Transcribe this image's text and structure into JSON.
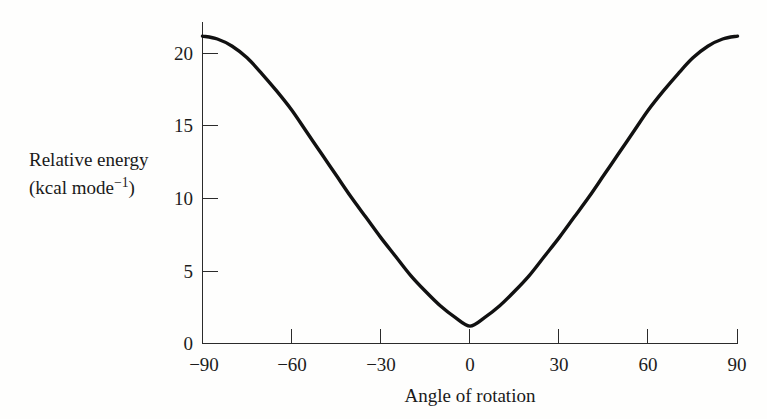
{
  "chart_data": {
    "type": "line",
    "title": "",
    "subtitle": "",
    "xlabel": "Angle of rotation",
    "ylabel_line1": "Relative energy",
    "ylabel_line2_prefix": "(kcal mode",
    "ylabel_line2_exponent": "−1",
    "ylabel_line2_suffix": ")",
    "ylabel_plain": "Relative energy (kcal mode−1)",
    "xlim": [
      -90,
      90
    ],
    "ylim": [
      0,
      22.5
    ],
    "xticks": [
      -90,
      -60,
      -30,
      0,
      30,
      60,
      90
    ],
    "xtick_labels": [
      "−90",
      "−60",
      "−30",
      "0",
      "30",
      "60",
      "90"
    ],
    "yticks": [
      0,
      5,
      10,
      15,
      20
    ],
    "ytick_labels": [
      "0",
      "5",
      "10",
      "15",
      "20"
    ],
    "grid": false,
    "legend": null,
    "tick_direction": "in",
    "axis_style": "left-and-bottom-spine",
    "curve_color": "#111111",
    "axis_color": "#2b2b2b",
    "background_color": "#fefefd",
    "series": [
      {
        "name": "Relative energy",
        "x": [
          -90,
          -85,
          -80,
          -75,
          -70,
          -65,
          -60,
          -55,
          -50,
          -45,
          -40,
          -35,
          -30,
          -25,
          -20,
          -15,
          -10,
          -5,
          0,
          5,
          10,
          15,
          20,
          25,
          30,
          35,
          40,
          45,
          50,
          55,
          60,
          65,
          70,
          75,
          80,
          85,
          90
        ],
        "y": [
          21.2,
          21.0,
          20.5,
          19.7,
          18.6,
          17.4,
          16.1,
          14.6,
          13.1,
          11.6,
          10.1,
          8.7,
          7.3,
          6.0,
          4.7,
          3.6,
          2.6,
          1.8,
          1.2,
          1.8,
          2.6,
          3.6,
          4.7,
          6.0,
          7.3,
          8.7,
          10.1,
          11.6,
          13.1,
          14.6,
          16.1,
          17.4,
          18.6,
          19.7,
          20.5,
          21.0,
          21.2
        ]
      }
    ],
    "annotations": {
      "minimum_value": 1.2,
      "minimum_at": 0,
      "maximum_value": 21.2,
      "maxima_at": [
        -90,
        90
      ]
    }
  }
}
